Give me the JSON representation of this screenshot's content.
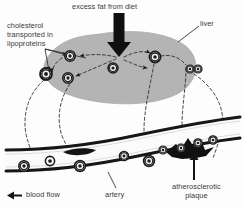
{
  "figure": {
    "width": 244,
    "height": 208,
    "background_color": "#fdfdfd"
  },
  "labels": {
    "excess_fat": "excess fat from diet",
    "cholesterol": "cholesterol\ntransported in\nlipoproteins",
    "liver": "liver",
    "artery": "artery",
    "plaque": "atherosclerotic\nplaque",
    "blood_flow": "blood flow"
  },
  "colors": {
    "organ_fill": "#b4b4b4",
    "organ_stroke": "#9a9a9a",
    "vessel_wall": "#1a1a1a",
    "vessel_lumen": "#fbfbfb",
    "dashed_path": "#2a2a2a",
    "arrow_fill": "#101010",
    "particle_ring": "#1c1c1c",
    "particle_mid": "#f2f2f2",
    "text": "#3a3a3a"
  },
  "structures": {
    "liver": {
      "name": "liver",
      "shape": "rounded-blob",
      "fill": "#b4b4b4"
    },
    "artery": {
      "name": "artery",
      "shape": "two-curved-walls",
      "wall_color": "#1a1a1a"
    },
    "plaque": {
      "name": "atherosclerotic-plaque",
      "shape": "jagged-deposit",
      "fill": "#101010"
    }
  },
  "particles": {
    "legend": "lipoprotein particle (concentric rings with radial spokes)",
    "liver_particles": [
      {
        "cx": 46,
        "cy": 74,
        "r": 6.0
      },
      {
        "cx": 70,
        "cy": 56,
        "r": 5.2
      },
      {
        "cx": 68,
        "cy": 78,
        "r": 5.2
      },
      {
        "cx": 155,
        "cy": 57,
        "r": 5.6
      },
      {
        "cx": 113,
        "cy": 68,
        "r": 5.0
      },
      {
        "cx": 190,
        "cy": 69,
        "r": 4.0
      },
      {
        "cx": 198,
        "cy": 69,
        "r": 4.0
      }
    ],
    "artery_particles": [
      {
        "cx": 24,
        "cy": 166,
        "r": 5.2
      },
      {
        "cx": 50,
        "cy": 161,
        "r": 4.6
      },
      {
        "cx": 80,
        "cy": 166,
        "r": 5.4
      },
      {
        "cx": 124,
        "cy": 156,
        "r": 4.6
      },
      {
        "cx": 149,
        "cy": 161,
        "r": 5.4
      },
      {
        "cx": 163,
        "cy": 150,
        "r": 4.0
      },
      {
        "cx": 181,
        "cy": 148,
        "r": 4.0
      },
      {
        "cx": 198,
        "cy": 143,
        "r": 4.2
      },
      {
        "cx": 213,
        "cy": 140,
        "r": 4.2
      }
    ]
  },
  "arrows": {
    "diet_arrow": {
      "name": "excess-fat-arrow",
      "direction": "down"
    },
    "blood_flow_arrow": {
      "name": "blood-flow-arrow",
      "direction": "left"
    },
    "plaque_pointer": {
      "name": "plaque-pointer-arrow",
      "direction": "up"
    }
  }
}
